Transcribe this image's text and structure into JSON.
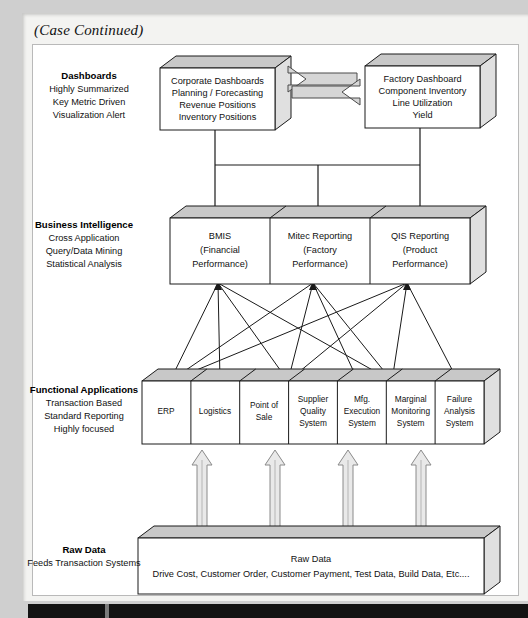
{
  "page": {
    "case_note": "(Case Continued)"
  },
  "layers": [
    {
      "id": "dashboards",
      "title": "Dashboards",
      "attributes": [
        "Highly Summarized",
        "Key Metric Driven",
        "Visualization Alert"
      ],
      "boxes": [
        {
          "id": "corporate-dashboards",
          "lines": [
            "Corporate Dashboards",
            "Planning / Forecasting",
            "Revenue Positions",
            "Inventory Positions"
          ]
        },
        {
          "id": "factory-dashboard",
          "lines": [
            "Factory Dashboard",
            "Component Inventory",
            "Line Utilization",
            "Yield"
          ]
        }
      ]
    },
    {
      "id": "business-intelligence",
      "title": "Business Intelligence",
      "attributes": [
        "Cross Application",
        "Query/Data Mining",
        "Statistical Analysis"
      ],
      "boxes": [
        {
          "id": "bmis",
          "lines": [
            "BMIS",
            "(Financial",
            "Performance)"
          ]
        },
        {
          "id": "mitec-reporting",
          "lines": [
            "Mitec Reporting",
            "(Factory",
            "Performance)"
          ]
        },
        {
          "id": "qis-reporting",
          "lines": [
            "QIS Reporting",
            "(Product",
            "Performance)"
          ]
        }
      ]
    },
    {
      "id": "functional-applications",
      "title": "Functional Applications",
      "attributes": [
        "Transaction Based",
        "Standard Reporting",
        "Highly focused"
      ],
      "boxes": [
        {
          "id": "erp",
          "lines": [
            "ERP"
          ]
        },
        {
          "id": "logistics",
          "lines": [
            "Logistics"
          ]
        },
        {
          "id": "point-of-sale",
          "lines": [
            "Point of",
            "Sale"
          ]
        },
        {
          "id": "supplier-quality-system",
          "lines": [
            "Supplier",
            "Quality",
            "System"
          ]
        },
        {
          "id": "mfg-execution-system",
          "lines": [
            "Mfg.",
            "Execution",
            "System"
          ]
        },
        {
          "id": "marginal-monitoring-system",
          "lines": [
            "Marginal",
            "Monitoring",
            "System"
          ]
        },
        {
          "id": "failure-analysis-system",
          "lines": [
            "Failure",
            "Analysis",
            "System"
          ]
        }
      ]
    },
    {
      "id": "raw-data",
      "title": "Raw Data",
      "attributes": [
        "Feeds Transaction Systems"
      ],
      "boxes": [
        {
          "id": "raw-data-store",
          "lines": [
            "Raw Data",
            "Drive Cost, Customer Order, Customer Payment, Test Data, Build Data, Etc...."
          ]
        }
      ]
    }
  ],
  "colors": {
    "box_face": "#ffffff",
    "box_top": "#c8c8c8",
    "box_side": "#e0e0e0",
    "line": "#1a1a1a",
    "paper": "#f3f3f1",
    "page_border": "#cfcfcf"
  }
}
